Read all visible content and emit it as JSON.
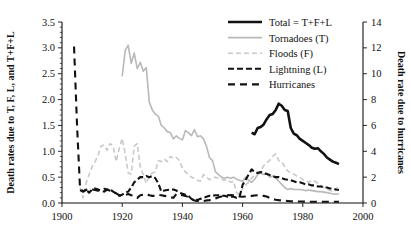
{
  "chart_data": {
    "type": "line",
    "title": "",
    "xlabel": "",
    "ylabel": "Death rates due to T, F, L, and T+F+L",
    "y2label": "Death rate due to hurricanes",
    "xlim": [
      1900,
      2000
    ],
    "ylim": [
      0.0,
      3.5
    ],
    "y2lim": [
      0,
      14
    ],
    "xticks": [
      1900,
      1920,
      1940,
      1960,
      1980,
      2000
    ],
    "xtick_labels": [
      "1900",
      "1920",
      "1940",
      "1960",
      "1980",
      "2000"
    ],
    "yticks": [
      0.0,
      0.5,
      1.0,
      1.5,
      2.0,
      2.5,
      3.0,
      3.5
    ],
    "ytick_labels": [
      "0.0",
      "0.5",
      "1.0",
      "1.5",
      "2.0",
      "2.5",
      "3.0",
      "3.5"
    ],
    "y2ticks": [
      0,
      2,
      4,
      6,
      8,
      10,
      12,
      14
    ],
    "y2tick_labels": [
      "0",
      "2",
      "4",
      "6",
      "8",
      "10",
      "12",
      "14"
    ],
    "grid": false,
    "legend_position": "top-right",
    "series": [
      {
        "name": "Total = T+F+L",
        "axis": "left",
        "color": "#121212",
        "width": 2.6,
        "dash": "none",
        "x": [
          1963,
          1964,
          1965,
          1966,
          1967,
          1968,
          1969,
          1970,
          1971,
          1972,
          1973,
          1974,
          1975,
          1976,
          1977,
          1978,
          1979,
          1980,
          1981,
          1982,
          1983,
          1984,
          1985,
          1986,
          1987,
          1988,
          1989,
          1990,
          1991,
          1992
        ],
        "values": [
          1.36,
          1.33,
          1.45,
          1.47,
          1.52,
          1.62,
          1.7,
          1.72,
          1.8,
          1.92,
          1.88,
          1.8,
          1.78,
          1.45,
          1.34,
          1.31,
          1.24,
          1.2,
          1.16,
          1.12,
          1.07,
          1.05,
          1.06,
          1.0,
          0.95,
          0.88,
          0.84,
          0.8,
          0.78,
          0.75
        ]
      },
      {
        "name": "Tornadoes (T)",
        "axis": "left",
        "color": "#b9b9b9",
        "width": 1.6,
        "dash": "none",
        "x": [
          1920,
          1921,
          1922,
          1923,
          1924,
          1925,
          1926,
          1927,
          1928,
          1929,
          1930,
          1931,
          1932,
          1933,
          1934,
          1935,
          1936,
          1937,
          1938,
          1939,
          1940,
          1941,
          1942,
          1943,
          1944,
          1945,
          1946,
          1947,
          1948,
          1949,
          1950,
          1951,
          1952,
          1953,
          1954,
          1955,
          1956,
          1957,
          1958,
          1959,
          1960,
          1961,
          1962,
          1963,
          1964,
          1965,
          1966,
          1967,
          1968,
          1969,
          1970,
          1971,
          1972,
          1973,
          1974,
          1975,
          1976,
          1977,
          1978,
          1979,
          1980,
          1981,
          1982,
          1983,
          1984,
          1985,
          1986,
          1987,
          1988,
          1989,
          1990,
          1991,
          1992
        ],
        "values": [
          2.45,
          2.95,
          3.05,
          2.7,
          2.9,
          2.6,
          2.72,
          2.55,
          2.62,
          1.95,
          1.8,
          1.72,
          1.68,
          1.5,
          1.45,
          1.38,
          1.36,
          1.24,
          1.3,
          1.25,
          1.22,
          1.4,
          1.36,
          1.3,
          1.42,
          1.28,
          1.3,
          1.24,
          1.1,
          0.88,
          0.82,
          0.6,
          0.55,
          0.5,
          0.48,
          0.5,
          0.48,
          0.5,
          0.46,
          0.44,
          0.42,
          0.5,
          0.44,
          0.4,
          0.46,
          0.55,
          0.58,
          0.55,
          0.58,
          0.5,
          0.52,
          0.48,
          0.42,
          0.36,
          0.3,
          0.26,
          0.28,
          0.26,
          0.26,
          0.26,
          0.25,
          0.24,
          0.25,
          0.24,
          0.23,
          0.22,
          0.22,
          0.21,
          0.2,
          0.19,
          0.18,
          0.17,
          0.18
        ]
      },
      {
        "name": "Floods (F)",
        "axis": "left",
        "color": "#c9c9c9",
        "width": 1.6,
        "dash": "5,3",
        "x": [
          1906,
          1907,
          1908,
          1909,
          1910,
          1911,
          1912,
          1913,
          1914,
          1915,
          1916,
          1917,
          1918,
          1919,
          1920,
          1921,
          1922,
          1923,
          1924,
          1925,
          1926,
          1927,
          1928,
          1929,
          1930,
          1931,
          1932,
          1933,
          1934,
          1935,
          1936,
          1937,
          1938,
          1939,
          1940,
          1941,
          1942,
          1943,
          1944,
          1945,
          1946,
          1947,
          1948,
          1949,
          1950,
          1951,
          1952,
          1953,
          1954,
          1955,
          1956,
          1957,
          1958,
          1959,
          1960,
          1961,
          1962,
          1963,
          1964,
          1965,
          1966,
          1967,
          1968,
          1969,
          1970,
          1971,
          1972,
          1973,
          1974,
          1975,
          1976,
          1977,
          1978,
          1979,
          1980,
          1981,
          1982,
          1983,
          1984,
          1985,
          1986,
          1987,
          1988,
          1989,
          1990,
          1991,
          1992
        ],
        "values": [
          0.3,
          0.1,
          0.38,
          0.55,
          0.7,
          0.8,
          0.92,
          1.1,
          1.12,
          1.02,
          1.15,
          1.1,
          0.8,
          1.05,
          1.25,
          0.95,
          0.58,
          0.56,
          1.1,
          1.15,
          0.7,
          0.55,
          0.38,
          0.52,
          0.58,
          0.6,
          0.82,
          0.8,
          0.85,
          0.8,
          0.9,
          0.86,
          0.88,
          0.82,
          0.68,
          0.6,
          0.55,
          0.5,
          0.48,
          0.44,
          0.42,
          0.55,
          0.5,
          0.45,
          0.48,
          0.5,
          0.48,
          0.46,
          0.44,
          0.45,
          0.4,
          0.42,
          0.2,
          0.16,
          0.28,
          0.35,
          0.4,
          0.48,
          0.55,
          0.58,
          0.62,
          0.72,
          0.78,
          0.82,
          0.9,
          0.95,
          0.82,
          0.8,
          0.7,
          0.62,
          0.58,
          0.56,
          0.52,
          0.5,
          0.45,
          0.42,
          0.4,
          0.44,
          0.42,
          0.38,
          0.34,
          0.3,
          0.26,
          0.24,
          0.22,
          0.25,
          0.35
        ]
      },
      {
        "name": "Lightning (L)",
        "axis": "left",
        "color": "#121212",
        "width": 2.1,
        "dash": "6,3",
        "x": [
          1906,
          1907,
          1908,
          1909,
          1910,
          1911,
          1912,
          1913,
          1914,
          1915,
          1916,
          1917,
          1918,
          1919,
          1920,
          1921,
          1922,
          1923,
          1924,
          1925,
          1926,
          1927,
          1928,
          1929,
          1930,
          1931,
          1932,
          1933,
          1934,
          1935,
          1936,
          1937,
          1938,
          1939,
          1940,
          1941,
          1942,
          1943,
          1944,
          1945,
          1946,
          1947,
          1948,
          1949,
          1950,
          1951,
          1952,
          1953,
          1954,
          1955,
          1956,
          1957,
          1958,
          1959,
          1960,
          1961,
          1962,
          1963,
          1964,
          1965,
          1966,
          1967,
          1968,
          1969,
          1970,
          1971,
          1972,
          1973,
          1974,
          1975,
          1976,
          1977,
          1978,
          1979,
          1980,
          1981,
          1982,
          1983,
          1984,
          1985,
          1986,
          1987,
          1988,
          1989,
          1990,
          1991,
          1992
        ],
        "values": [
          0.25,
          0.22,
          0.26,
          0.2,
          0.26,
          0.28,
          0.26,
          0.24,
          0.22,
          0.26,
          0.26,
          0.22,
          0.18,
          0.14,
          0.16,
          0.2,
          0.22,
          0.3,
          0.4,
          0.45,
          0.5,
          0.5,
          0.52,
          0.5,
          0.52,
          0.48,
          0.38,
          0.22,
          0.24,
          0.25,
          0.26,
          0.26,
          0.24,
          0.2,
          0.18,
          0.16,
          0.14,
          0.08,
          0.05,
          0.06,
          0.08,
          0.1,
          0.12,
          0.14,
          0.14,
          0.15,
          0.15,
          0.14,
          0.14,
          0.12,
          0.12,
          0.12,
          0.1,
          0.12,
          0.35,
          0.45,
          0.55,
          0.65,
          0.6,
          0.58,
          0.6,
          0.58,
          0.56,
          0.54,
          0.52,
          0.5,
          0.5,
          0.48,
          0.46,
          0.45,
          0.44,
          0.42,
          0.4,
          0.4,
          0.38,
          0.36,
          0.36,
          0.34,
          0.34,
          0.32,
          0.32,
          0.3,
          0.3,
          0.28,
          0.28,
          0.26,
          0.25
        ]
      },
      {
        "name": "Hurricanes",
        "axis": "right",
        "color": "#121212",
        "width": 2.1,
        "dash": "7,5",
        "x": [
          1904,
          1905,
          1906,
          1907,
          1908,
          1909,
          1910,
          1911,
          1912,
          1913,
          1914,
          1915,
          1916,
          1917,
          1918,
          1919,
          1920,
          1921,
          1922,
          1923,
          1924,
          1925,
          1926,
          1927,
          1928,
          1929,
          1930,
          1931,
          1932,
          1933,
          1934,
          1935,
          1936,
          1937,
          1938,
          1939,
          1940,
          1941,
          1942,
          1943,
          1944,
          1945,
          1946,
          1947,
          1948,
          1949,
          1950,
          1951,
          1952,
          1953,
          1954,
          1955,
          1956,
          1957,
          1958,
          1959,
          1960,
          1961,
          1962,
          1963,
          1964,
          1965,
          1966,
          1967,
          1968,
          1969,
          1970,
          1971,
          1972,
          1973,
          1974,
          1975,
          1976,
          1977,
          1978,
          1979,
          1980,
          1981,
          1982,
          1983,
          1984,
          1985,
          1986,
          1987,
          1988,
          1989,
          1990,
          1991,
          1992
        ],
        "values": [
          12.1,
          6.0,
          1.1,
          0.9,
          1.0,
          1.1,
          1.05,
          1.0,
          0.95,
          1.0,
          1.1,
          1.05,
          0.95,
          0.85,
          0.75,
          0.6,
          0.55,
          0.6,
          0.7,
          0.6,
          0.55,
          0.4,
          0.6,
          0.65,
          0.7,
          0.6,
          0.55,
          0.55,
          0.62,
          0.6,
          0.55,
          0.5,
          0.45,
          0.4,
          0.7,
          0.65,
          0.6,
          0.55,
          0.45,
          0.3,
          0.2,
          0.15,
          0.12,
          0.15,
          0.2,
          0.22,
          0.25,
          0.35,
          0.45,
          0.5,
          0.55,
          0.6,
          0.62,
          0.6,
          0.55,
          0.5,
          0.48,
          0.5,
          0.52,
          0.55,
          0.58,
          0.6,
          0.58,
          0.55,
          0.5,
          0.4,
          0.3,
          0.25,
          0.22,
          0.2,
          0.18,
          0.16,
          0.14,
          0.12,
          0.12,
          0.12,
          0.12,
          0.1,
          0.1,
          0.1,
          0.1,
          0.1,
          0.1,
          0.1,
          0.1,
          0.1,
          0.1,
          0.1,
          0.1
        ]
      }
    ]
  },
  "legend": {
    "entries": [
      {
        "label": "Total = T+F+L"
      },
      {
        "label": "Tornadoes (T)"
      },
      {
        "label": "Floods (F)"
      },
      {
        "label": "Lightning (L)"
      },
      {
        "label": "Hurricanes"
      }
    ]
  },
  "axes": {
    "left_title": "Death rates due to T, F, L, and T+F+L",
    "right_title": "Death rate due to hurricanes"
  }
}
